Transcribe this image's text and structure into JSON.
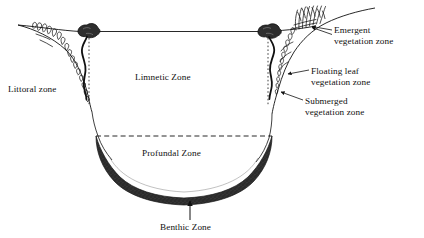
{
  "figure": {
    "background_color": "#ffffff",
    "ink_color": "#111111",
    "sediment_color": "#2b2b2b",
    "width": 424,
    "height": 238
  },
  "labels": {
    "littoral": "Littoral zone",
    "limnetic": "Limnetic Zone",
    "profundal": "Profundal Zone",
    "benthic": "Benthic Zone",
    "emergent_line1": "Emergent",
    "emergent_line2": "vegetation zone",
    "floating_line1": "Floating leaf",
    "floating_line2": "vegetation zone",
    "submerged_line1": "Submerged",
    "submerged_line2": "vegetation zone"
  },
  "features": {
    "waterline_label": "water-surface-line",
    "thermocline_label": "thermocline-dashed-line",
    "left_boundary_label": "left-littoral-boundary-dotted-line",
    "right_boundary_label": "right-littoral-boundary-dotted-line",
    "sediment_label": "benthic-sediment-layer",
    "left_lily_label": "left-floating-leaf-plant",
    "right_lily_label": "right-floating-leaf-plant"
  }
}
